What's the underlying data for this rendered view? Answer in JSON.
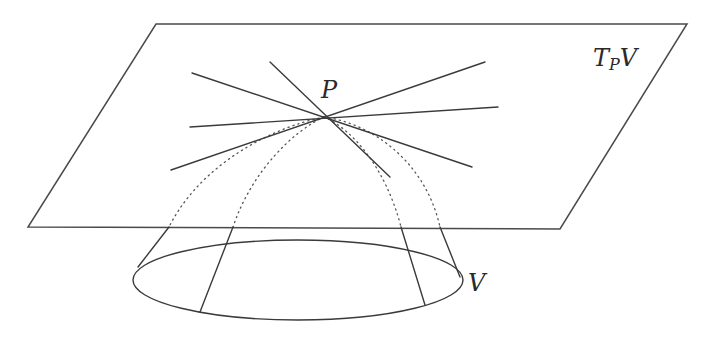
{
  "figure": {
    "labels": {
      "tangent_space_main": "T",
      "tangent_space_sub": "P",
      "tangent_space_tail": "V",
      "point": "P",
      "variety": "V"
    },
    "colors": {
      "stroke": "#3a3a3a",
      "background": "#ffffff"
    },
    "point_P": [
      324,
      117
    ],
    "plane_corners": [
      [
        156,
        24
      ],
      [
        687,
        24
      ],
      [
        560,
        229
      ],
      [
        28,
        227
      ]
    ],
    "tangent_lines": [
      {
        "from": [
          192,
          73
        ],
        "to": [
          472,
          167
        ]
      },
      {
        "from": [
          270,
          62
        ],
        "to": [
          390,
          177
        ]
      },
      {
        "from": [
          190,
          127
        ],
        "to": [
          498,
          107
        ]
      },
      {
        "from": [
          171,
          170
        ],
        "to": [
          485,
          62
        ]
      }
    ],
    "ellipse": {
      "cx": 298,
      "cy": 280,
      "rx": 165,
      "ry": 40
    },
    "generators": [
      {
        "from": [
          169,
          227
        ],
        "to": [
          138,
          267
        ]
      },
      {
        "from": [
          233,
          227
        ],
        "to": [
          200,
          312
        ]
      },
      {
        "from": [
          401,
          227
        ],
        "to": [
          425,
          305
        ]
      },
      {
        "from": [
          440,
          227
        ],
        "to": [
          460,
          277
        ]
      }
    ]
  }
}
